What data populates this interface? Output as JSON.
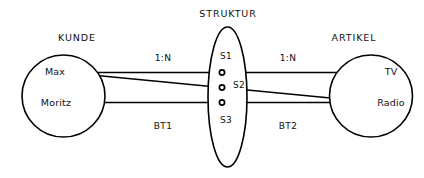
{
  "diagram": {
    "type": "entity-relationship-network",
    "background_color": "#ffffff",
    "line_color": "#000000",
    "text_color": "#111111",
    "entities": {
      "left": {
        "title": "KUNDE",
        "shape": "circle",
        "members": [
          {
            "label": "Max"
          },
          {
            "label": "Moritz"
          }
        ]
      },
      "center": {
        "title": "STRUKTUR",
        "shape": "ellipse",
        "members": [
          {
            "label": "S1"
          },
          {
            "label": "S2"
          },
          {
            "label": "S3"
          }
        ]
      },
      "right": {
        "title": "ARTIKEL",
        "shape": "circle",
        "members": [
          {
            "label": "TV"
          },
          {
            "label": "Radio"
          }
        ]
      }
    },
    "cardinalities": {
      "left_link": "1:N",
      "right_link": "1:N"
    },
    "relationships": {
      "left": "BT1",
      "right": "BT2"
    }
  }
}
